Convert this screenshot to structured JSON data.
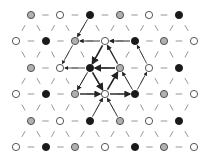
{
  "diagram": {
    "type": "triangular-lattice",
    "colors": {
      "gray": "#b0b0b0",
      "white": "#ffffff",
      "black": "#1a1a1a",
      "stroke": "#444444",
      "light_edge": "#8a8a8a",
      "bold_edge": "#222222"
    },
    "rows": [
      {
        "y": 15,
        "nodes": [
          {
            "x": 31,
            "c": "gray"
          },
          {
            "x": 60,
            "c": "white"
          },
          {
            "x": 90,
            "c": "black"
          },
          {
            "x": 120,
            "c": "gray"
          },
          {
            "x": 149,
            "c": "white"
          },
          {
            "x": 179,
            "c": "black"
          }
        ]
      },
      {
        "y": 41,
        "nodes": [
          {
            "x": 16,
            "c": "white"
          },
          {
            "x": 46,
            "c": "black"
          },
          {
            "x": 75,
            "c": "gray"
          },
          {
            "x": 105,
            "c": "white"
          },
          {
            "x": 135,
            "c": "black"
          },
          {
            "x": 164,
            "c": "gray"
          },
          {
            "x": 194,
            "c": "white"
          }
        ]
      },
      {
        "y": 68,
        "nodes": [
          {
            "x": 31,
            "c": "gray"
          },
          {
            "x": 60,
            "c": "white"
          },
          {
            "x": 90,
            "c": "black"
          },
          {
            "x": 120,
            "c": "gray"
          },
          {
            "x": 149,
            "c": "white"
          },
          {
            "x": 179,
            "c": "black"
          }
        ]
      },
      {
        "y": 94,
        "nodes": [
          {
            "x": 16,
            "c": "white"
          },
          {
            "x": 46,
            "c": "black"
          },
          {
            "x": 75,
            "c": "gray"
          },
          {
            "x": 105,
            "c": "white"
          },
          {
            "x": 135,
            "c": "black"
          },
          {
            "x": 164,
            "c": "gray"
          },
          {
            "x": 194,
            "c": "white"
          }
        ]
      },
      {
        "y": 121,
        "nodes": [
          {
            "x": 31,
            "c": "gray"
          },
          {
            "x": 60,
            "c": "white"
          },
          {
            "x": 90,
            "c": "black"
          },
          {
            "x": 120,
            "c": "gray"
          },
          {
            "x": 149,
            "c": "white"
          },
          {
            "x": 179,
            "c": "black"
          }
        ]
      },
      {
        "y": 147,
        "nodes": [
          {
            "x": 16,
            "c": "white"
          },
          {
            "x": 46,
            "c": "black"
          },
          {
            "x": 75,
            "c": "gray"
          },
          {
            "x": 105,
            "c": "white"
          },
          {
            "x": 135,
            "c": "black"
          },
          {
            "x": 164,
            "c": "gray"
          },
          {
            "x": 194,
            "c": "white"
          }
        ]
      }
    ],
    "bold_arrows": [
      {
        "from": [
          105,
          41
        ],
        "to": [
          90,
          68
        ],
        "w": 1.6
      },
      {
        "from": [
          120,
          68
        ],
        "to": [
          90,
          68
        ],
        "w": 1.6
      },
      {
        "from": [
          90,
          68
        ],
        "to": [
          105,
          94
        ],
        "w": 1.6
      },
      {
        "from": [
          105,
          94
        ],
        "to": [
          120,
          68
        ],
        "w": 1.6
      },
      {
        "from": [
          75,
          94
        ],
        "to": [
          105,
          94
        ],
        "w": 1.4
      },
      {
        "from": [
          105,
          94
        ],
        "to": [
          135,
          94
        ],
        "w": 1.4
      },
      {
        "from": [
          120,
          68
        ],
        "to": [
          105,
          41
        ],
        "w": 1.1
      },
      {
        "from": [
          135,
          41
        ],
        "to": [
          105,
          41
        ],
        "w": 1.0
      },
      {
        "from": [
          90,
          68
        ],
        "to": [
          75,
          94
        ],
        "w": 1.0
      },
      {
        "from": [
          105,
          41
        ],
        "to": [
          75,
          41
        ],
        "w": 0.9
      },
      {
        "from": [
          90,
          15
        ],
        "to": [
          75,
          41
        ],
        "w": 0.9
      },
      {
        "from": [
          135,
          94
        ],
        "to": [
          120,
          68
        ],
        "w": 0.9
      },
      {
        "from": [
          120,
          121
        ],
        "to": [
          105,
          94
        ],
        "w": 0.9
      },
      {
        "from": [
          90,
          121
        ],
        "to": [
          105,
          94
        ],
        "w": 0.9
      },
      {
        "from": [
          75,
          41
        ],
        "to": [
          60,
          68
        ],
        "w": 0.8
      },
      {
        "from": [
          90,
          68
        ],
        "to": [
          60,
          68
        ],
        "w": 0.8
      },
      {
        "from": [
          149,
          68
        ],
        "to": [
          135,
          41
        ],
        "w": 0.8
      },
      {
        "from": [
          135,
          94
        ],
        "to": [
          149,
          68
        ],
        "w": 0.8
      }
    ]
  }
}
